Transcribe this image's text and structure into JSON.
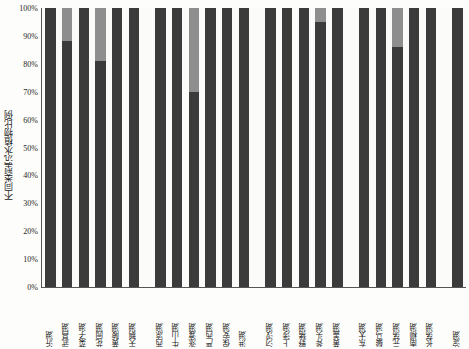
{
  "chart_data": {
    "type": "bar",
    "stacked": true,
    "normalized": true,
    "title": "",
    "subtitle": "",
    "xlabel": "",
    "ylabel": "不同类型沉水植物比例",
    "ylim": [
      0,
      100
    ],
    "ytick_labels": [
      "0%",
      "10%",
      "20%",
      "30%",
      "40%",
      "50%",
      "60%",
      "70%",
      "80%",
      "90%",
      "100%"
    ],
    "ytick_values": [
      0,
      10,
      20,
      30,
      40,
      50,
      60,
      70,
      80,
      90,
      100
    ],
    "grid": false,
    "legend": "none",
    "series": [
      {
        "name": "类型一",
        "color": "#3b3b3b"
      },
      {
        "name": "类型二",
        "color": "#8e8e8e"
      },
      {
        "name": "类型三",
        "color": "#d8d8d4"
      }
    ],
    "groups": [
      {
        "name": "组一",
        "categories": [
          "沂湖",
          "武昌湖",
          "菜子湖",
          "花园湖",
          "黄陂湖",
          "天鹅湖"
        ],
        "values": [
          [
            100,
            0,
            0
          ],
          [
            88,
            12,
            0
          ],
          [
            100,
            0,
            0
          ],
          [
            81,
            19,
            0
          ],
          [
            100,
            0,
            0
          ],
          [
            100,
            0,
            0
          ]
        ]
      },
      {
        "name": "组二",
        "categories": [
          "西凉湖",
          "牛山湖",
          "涨渡湖",
          "严西湖",
          "保安湖",
          "洪湖"
        ],
        "values": [
          [
            100,
            0,
            0
          ],
          [
            100,
            0,
            0
          ],
          [
            70,
            30,
            0
          ],
          [
            100,
            0,
            0
          ],
          [
            100,
            0,
            0
          ],
          [
            100,
            0,
            0
          ]
        ]
      },
      {
        "name": "组三",
        "categories": [
          "汈汊湖",
          "上涉湖",
          "野猪湖",
          "斧头湖",
          "黄盖湖"
        ],
        "values": [
          [
            100,
            0,
            0
          ],
          [
            100,
            0,
            0
          ],
          [
            100,
            0,
            0
          ],
          [
            95,
            5,
            0
          ],
          [
            100,
            0,
            0
          ]
        ]
      },
      {
        "name": "组四",
        "categories": [
          "东太湖",
          "鬃马湖",
          "元荡湖",
          "南柳湖",
          "长荡湖"
        ],
        "values": [
          [
            100,
            0,
            0
          ],
          [
            100,
            0,
            0
          ],
          [
            86,
            14,
            0
          ],
          [
            100,
            0,
            0
          ],
          [
            100,
            0,
            0
          ]
        ]
      },
      {
        "name": "组五",
        "categories": [
          "淀湖"
        ],
        "values": [
          [
            100,
            0,
            0
          ]
        ]
      }
    ]
  }
}
